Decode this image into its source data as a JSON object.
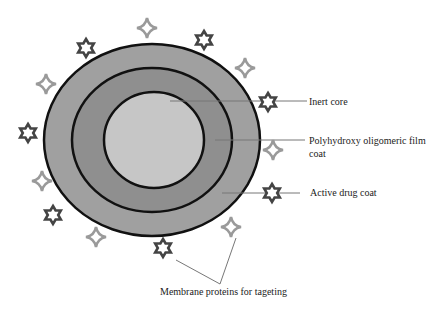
{
  "diagram": {
    "colors": {
      "inner_core": "#c6c6c6",
      "middle_ring": "#8f8f8f",
      "outer_ring": "#a0a0a0",
      "ring_stroke": "#111111",
      "star6": "#444444",
      "star4": "#9a9a9a",
      "leader_line": "#777777"
    },
    "labels": {
      "inert_core": "Inert core",
      "polyhydroxy_line1": "Polyhydroxy oligomeric film",
      "polyhydroxy_line2": "coat",
      "active_drug": "Active drug coat",
      "membrane": "Membrane proteins for tageting"
    },
    "icons": {
      "hexagram": "six-pointed-star-icon",
      "four_point": "four-pointed-star-icon"
    }
  }
}
